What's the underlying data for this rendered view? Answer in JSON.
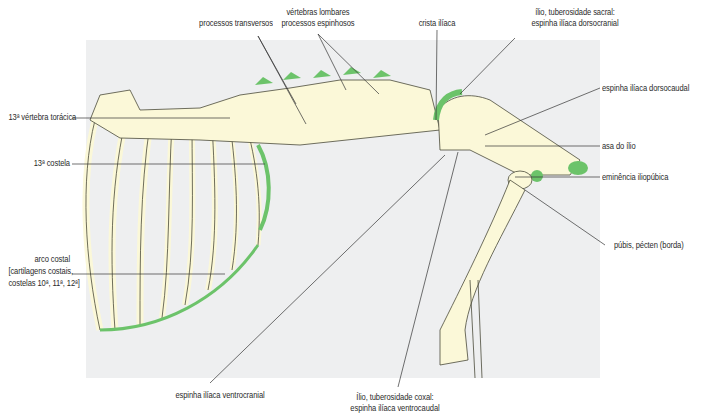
{
  "figure": {
    "type": "anatomical illustration",
    "colors": {
      "background_panel": "#eeeff0",
      "bone": "#fbf8d8",
      "bone_outline": "#4a4a3a",
      "highlight_green": "#6cc36a",
      "leader_line": "#333333",
      "label_text": "#2b2b2b"
    }
  },
  "labels": {
    "processos_transversos": "processos transversos",
    "vertebras_lombares_l1": "vértebras lombares",
    "vertebras_lombares_l2": "processos espinhosos",
    "crista_iliaca": "crista ilíaca",
    "ilio_sacral_l1": "ílio, tuberosidade sacral:",
    "ilio_sacral_l2": "espinha ilíaca dorsocranial",
    "espinha_dorsocaudal": "espinha ilíaca dorsocaudal",
    "vertebra_toracica": "13ª vértebra torácica",
    "costela": "13ª costela",
    "asa_ilio": "asa do ílio",
    "eminencia": "eminência iliopúbica",
    "arco_costal_l1": "arco costal",
    "arco_costal_l2": "[cartilagens costais,",
    "arco_costal_l3": "costelas 10ª, 11ª, 12ª]",
    "pubis": "púbis, pécten (borda)",
    "espinha_ventrocranial": "espinha ilíaca ventrocranial",
    "ilio_coxal_l1": "Ílio, tuberosidade coxal:",
    "ilio_coxal_l2": "espinha ilíaca ventrocaudal"
  }
}
